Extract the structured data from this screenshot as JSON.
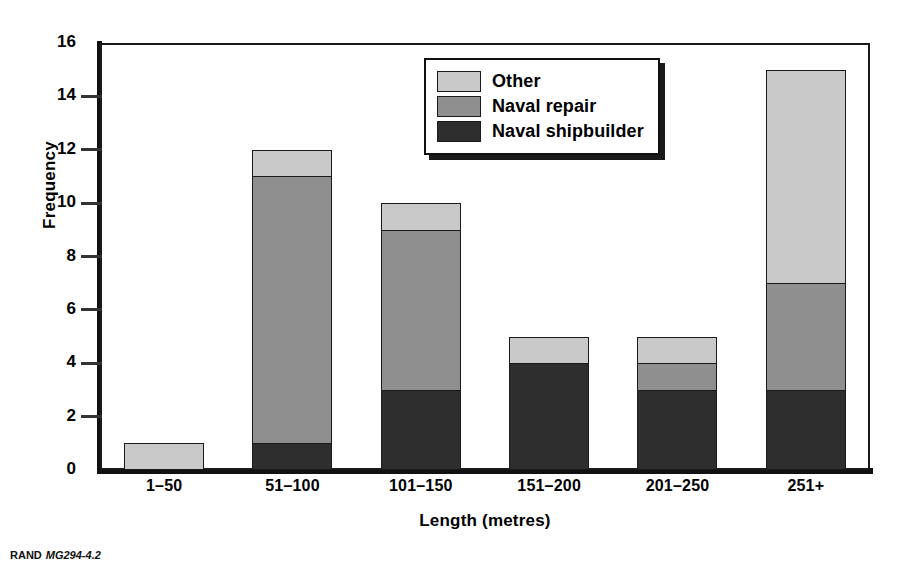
{
  "chart_data": {
    "type": "bar",
    "subtype": "stacked-vertical-bar",
    "title": "",
    "xlabel": "Length (metres)",
    "ylabel": "Frequency",
    "categories": [
      "1–50",
      "51–100",
      "101–150",
      "151–200",
      "201–250",
      "251+"
    ],
    "series": [
      {
        "name": "Naval shipbuilder",
        "color": "#2e2e2e",
        "values": [
          0,
          1,
          3,
          4,
          3,
          3
        ]
      },
      {
        "name": "Naval repair",
        "color": "#8f8f8f",
        "values": [
          0,
          10,
          6,
          0,
          1,
          4
        ]
      },
      {
        "name": "Other",
        "color": "#c9c9c9",
        "values": [
          1,
          1,
          1,
          1,
          1,
          8
        ]
      }
    ],
    "stack_order_bottom_to_top": [
      "Naval shipbuilder",
      "Naval repair",
      "Other"
    ],
    "totals": [
      1,
      12,
      10,
      5,
      5,
      15
    ],
    "ylim": [
      0,
      16
    ],
    "ytick_values": [
      0,
      2,
      4,
      6,
      8,
      10,
      12,
      14,
      16
    ],
    "ytick_labels": [
      "0",
      "2",
      "4",
      "6",
      "8",
      "10",
      "12",
      "14",
      "16"
    ],
    "grid": false,
    "legend_position": "top-right",
    "legend_entries": [
      "Other",
      "Naval repair",
      "Naval shipbuilder"
    ]
  },
  "axes": {
    "y_title": "Frequency",
    "x_title": "Length (metres)"
  },
  "legend": {
    "items": [
      {
        "label": "Other",
        "color": "#c9c9c9"
      },
      {
        "label": "Naval repair",
        "color": "#8f8f8f"
      },
      {
        "label": "Naval shipbuilder",
        "color": "#2e2e2e"
      }
    ]
  },
  "caption": {
    "publisher": "RAND",
    "figure_code": "MG294-4.2"
  },
  "colors": {
    "other": "#c9c9c9",
    "naval_repair": "#8f8f8f",
    "naval_shipbuilder": "#2e2e2e",
    "axis": "#111111",
    "background": "#ffffff"
  }
}
